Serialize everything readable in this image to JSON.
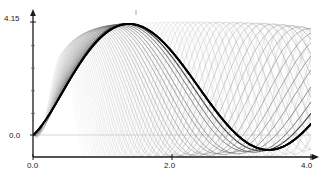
{
  "chart_data": {
    "type": "line",
    "title": "",
    "subtitle": "",
    "xlabel": "",
    "ylabel": "",
    "xlim": [
      0.0,
      4.0
    ],
    "ylim": [
      -0.62,
      4.15
    ],
    "grid": false,
    "legend": null,
    "legend_position": "none",
    "x_ticks": [
      0.0,
      2.0,
      4.0
    ],
    "x_tick_labels": [
      "0.0",
      "2.0",
      "4.0"
    ],
    "y_ticks": [
      0.0,
      4.15
    ],
    "y_tick_labels": [
      "0.0",
      "4.15"
    ],
    "annotations": [
      "ensemble of oscillatory trajectories",
      "curves clipped at upper bound 4.15",
      "trajectories converge near x=0 and re-converge near x=3.5"
    ],
    "series_count": 46,
    "series": [
      {
        "name": "traj-01",
        "frequency": 1.52,
        "phase": -0.48,
        "amplitude": 2.38,
        "offset": 1.76,
        "gray": "#111111",
        "width": 1.7,
        "opacity": 1.0
      },
      {
        "name": "traj-02",
        "frequency": 1.58,
        "phase": -0.5,
        "amplitude": 2.4,
        "offset": 1.76,
        "gray": "#2a2a2a",
        "width": 1.2,
        "opacity": 0.9
      },
      {
        "name": "traj-03",
        "frequency": 1.64,
        "phase": -0.52,
        "amplitude": 2.42,
        "offset": 1.74,
        "gray": "#3a3a3a",
        "width": 1.0,
        "opacity": 0.85
      },
      {
        "name": "traj-04",
        "frequency": 1.71,
        "phase": -0.55,
        "amplitude": 2.4,
        "offset": 1.75,
        "gray": "#444444",
        "width": 0.9,
        "opacity": 0.8
      },
      {
        "name": "traj-05",
        "frequency": 1.79,
        "phase": -0.57,
        "amplitude": 2.44,
        "offset": 1.72,
        "gray": "#4e4e4e",
        "width": 0.8,
        "opacity": 0.78
      },
      {
        "name": "traj-06",
        "frequency": 1.86,
        "phase": -0.59,
        "amplitude": 2.41,
        "offset": 1.74,
        "gray": "#555555",
        "width": 0.8,
        "opacity": 0.75
      },
      {
        "name": "traj-07",
        "frequency": 1.94,
        "phase": -0.61,
        "amplitude": 2.45,
        "offset": 1.71,
        "gray": "#5c5c5c",
        "width": 0.8,
        "opacity": 0.72
      },
      {
        "name": "traj-08",
        "frequency": 2.02,
        "phase": -0.63,
        "amplitude": 2.43,
        "offset": 1.73,
        "gray": "#626262",
        "width": 0.75,
        "opacity": 0.7
      },
      {
        "name": "traj-09",
        "frequency": 2.11,
        "phase": -0.65,
        "amplitude": 2.46,
        "offset": 1.7,
        "gray": "#686868",
        "width": 0.75,
        "opacity": 0.68
      },
      {
        "name": "traj-10",
        "frequency": 2.2,
        "phase": -0.67,
        "amplitude": 2.44,
        "offset": 1.72,
        "gray": "#6e6e6e",
        "width": 0.7,
        "opacity": 0.66
      },
      {
        "name": "traj-11",
        "frequency": 2.29,
        "phase": -0.69,
        "amplitude": 2.47,
        "offset": 1.69,
        "gray": "#737373",
        "width": 0.7,
        "opacity": 0.64
      },
      {
        "name": "traj-12",
        "frequency": 2.38,
        "phase": -0.71,
        "amplitude": 2.45,
        "offset": 1.71,
        "gray": "#787878",
        "width": 0.7,
        "opacity": 0.62
      },
      {
        "name": "traj-13",
        "frequency": 2.48,
        "phase": -0.73,
        "amplitude": 2.48,
        "offset": 1.68,
        "gray": "#7d7d7d",
        "width": 0.7,
        "opacity": 0.6
      },
      {
        "name": "traj-14",
        "frequency": 2.58,
        "phase": -0.75,
        "amplitude": 2.46,
        "offset": 1.7,
        "gray": "#818181",
        "width": 0.65,
        "opacity": 0.6
      },
      {
        "name": "traj-15",
        "frequency": 2.68,
        "phase": -0.77,
        "amplitude": 2.49,
        "offset": 1.67,
        "gray": "#858585",
        "width": 0.65,
        "opacity": 0.58
      },
      {
        "name": "traj-16",
        "frequency": 2.79,
        "phase": -0.79,
        "amplitude": 2.47,
        "offset": 1.69,
        "gray": "#898989",
        "width": 0.65,
        "opacity": 0.57
      },
      {
        "name": "traj-17",
        "frequency": 2.9,
        "phase": -0.81,
        "amplitude": 2.5,
        "offset": 1.66,
        "gray": "#8d8d8d",
        "width": 0.65,
        "opacity": 0.56
      },
      {
        "name": "traj-18",
        "frequency": 3.01,
        "phase": -0.83,
        "amplitude": 2.48,
        "offset": 1.68,
        "gray": "#909090",
        "width": 0.6,
        "opacity": 0.55
      },
      {
        "name": "traj-19",
        "frequency": 3.13,
        "phase": -0.85,
        "amplitude": 2.51,
        "offset": 1.65,
        "gray": "#939393",
        "width": 0.6,
        "opacity": 0.54
      },
      {
        "name": "traj-20",
        "frequency": 3.25,
        "phase": -0.87,
        "amplitude": 2.49,
        "offset": 1.67,
        "gray": "#969696",
        "width": 0.6,
        "opacity": 0.53
      },
      {
        "name": "traj-21",
        "frequency": 3.37,
        "phase": -0.89,
        "amplitude": 2.52,
        "offset": 1.64,
        "gray": "#999999",
        "width": 0.6,
        "opacity": 0.52
      },
      {
        "name": "traj-22",
        "frequency": 3.5,
        "phase": -0.91,
        "amplitude": 2.5,
        "offset": 1.66,
        "gray": "#9c9c9c",
        "width": 0.6,
        "opacity": 0.51
      },
      {
        "name": "traj-23",
        "frequency": 3.63,
        "phase": -0.93,
        "amplitude": 2.53,
        "offset": 1.63,
        "gray": "#9f9f9f",
        "width": 0.55,
        "opacity": 0.5
      },
      {
        "name": "traj-24",
        "frequency": 3.76,
        "phase": -0.95,
        "amplitude": 2.51,
        "offset": 1.65,
        "gray": "#a2a2a2",
        "width": 0.55,
        "opacity": 0.5
      },
      {
        "name": "traj-25",
        "frequency": 3.9,
        "phase": -0.97,
        "amplitude": 2.54,
        "offset": 1.62,
        "gray": "#a5a5a5",
        "width": 0.55,
        "opacity": 0.49
      },
      {
        "name": "traj-26",
        "frequency": 4.04,
        "phase": -0.99,
        "amplitude": 2.52,
        "offset": 1.64,
        "gray": "#a8a8a8",
        "width": 0.55,
        "opacity": 0.48
      },
      {
        "name": "traj-27",
        "frequency": 4.19,
        "phase": -1.01,
        "amplitude": 2.55,
        "offset": 1.61,
        "gray": "#ababab",
        "width": 0.55,
        "opacity": 0.47
      },
      {
        "name": "traj-28",
        "frequency": 4.34,
        "phase": -1.03,
        "amplitude": 2.53,
        "offset": 1.63,
        "gray": "#aeaeae",
        "width": 0.5,
        "opacity": 0.46
      },
      {
        "name": "traj-29",
        "frequency": 4.49,
        "phase": -1.05,
        "amplitude": 2.56,
        "offset": 1.6,
        "gray": "#b1b1b1",
        "width": 0.5,
        "opacity": 0.46
      },
      {
        "name": "traj-30",
        "frequency": 4.65,
        "phase": -1.07,
        "amplitude": 2.54,
        "offset": 1.62,
        "gray": "#b4b4b4",
        "width": 0.5,
        "opacity": 0.45
      },
      {
        "name": "traj-31",
        "frequency": 4.81,
        "phase": -1.09,
        "amplitude": 2.57,
        "offset": 1.59,
        "gray": "#b7b7b7",
        "width": 0.5,
        "opacity": 0.44
      },
      {
        "name": "traj-32",
        "frequency": 4.98,
        "phase": -1.11,
        "amplitude": 2.55,
        "offset": 1.61,
        "gray": "#bababa",
        "width": 0.5,
        "opacity": 0.44
      },
      {
        "name": "traj-33",
        "frequency": 5.15,
        "phase": -1.13,
        "amplitude": 2.58,
        "offset": 1.58,
        "gray": "#bdbdbd",
        "width": 0.5,
        "opacity": 0.43
      },
      {
        "name": "traj-34",
        "frequency": 5.33,
        "phase": -1.15,
        "amplitude": 2.56,
        "offset": 1.6,
        "gray": "#c0c0c0",
        "width": 0.5,
        "opacity": 0.42
      },
      {
        "name": "traj-35",
        "frequency": 5.51,
        "phase": -1.17,
        "amplitude": 2.59,
        "offset": 1.57,
        "gray": "#c3c3c3",
        "width": 0.5,
        "opacity": 0.42
      },
      {
        "name": "traj-36",
        "frequency": 5.7,
        "phase": -1.19,
        "amplitude": 2.57,
        "offset": 1.59,
        "gray": "#c6c6c6",
        "width": 0.45,
        "opacity": 0.41
      },
      {
        "name": "traj-37",
        "frequency": 5.89,
        "phase": -1.21,
        "amplitude": 2.6,
        "offset": 1.56,
        "gray": "#c9c9c9",
        "width": 0.45,
        "opacity": 0.4
      },
      {
        "name": "traj-38",
        "frequency": 6.09,
        "phase": -1.23,
        "amplitude": 2.58,
        "offset": 1.58,
        "gray": "#cccccc",
        "width": 0.45,
        "opacity": 0.4
      },
      {
        "name": "traj-39",
        "frequency": 6.29,
        "phase": -1.25,
        "amplitude": 2.61,
        "offset": 1.55,
        "gray": "#cfcfcf",
        "width": 0.45,
        "opacity": 0.39
      },
      {
        "name": "traj-40",
        "frequency": 6.5,
        "phase": -1.27,
        "amplitude": 2.59,
        "offset": 1.57,
        "gray": "#d2d2d2",
        "width": 0.45,
        "opacity": 0.38
      },
      {
        "name": "traj-41",
        "frequency": 6.72,
        "phase": -1.29,
        "amplitude": 2.62,
        "offset": 1.54,
        "gray": "#d4d4d4",
        "width": 0.45,
        "opacity": 0.38
      },
      {
        "name": "traj-42",
        "frequency": 6.94,
        "phase": -1.31,
        "amplitude": 2.6,
        "offset": 1.56,
        "gray": "#d7d7d7",
        "width": 0.45,
        "opacity": 0.37
      },
      {
        "name": "traj-43",
        "frequency": 7.17,
        "phase": -1.33,
        "amplitude": 2.63,
        "offset": 1.53,
        "gray": "#d9d9d9",
        "width": 0.4,
        "opacity": 0.36
      },
      {
        "name": "traj-44",
        "frequency": 7.4,
        "phase": -1.35,
        "amplitude": 2.61,
        "offset": 1.55,
        "gray": "#dbdbdb",
        "width": 0.4,
        "opacity": 0.36
      },
      {
        "name": "traj-45",
        "frequency": 7.64,
        "phase": -1.37,
        "amplitude": 2.64,
        "offset": 1.52,
        "gray": "#dddddd",
        "width": 0.4,
        "opacity": 0.35
      },
      {
        "name": "traj-46",
        "frequency": 7.89,
        "phase": -1.39,
        "amplitude": 2.62,
        "offset": 1.54,
        "gray": "#dfdfdf",
        "width": 0.4,
        "opacity": 0.34
      }
    ],
    "highlighted_series": [
      {
        "name": "bold-left",
        "frequency": 1.52,
        "phase": -0.48,
        "amplitude": 2.38,
        "offset": 1.76,
        "gray": "#000000",
        "width": 1.9,
        "opacity": 1.0
      },
      {
        "name": "bold-right",
        "frequency": 1.52,
        "phase": -0.48,
        "amplitude": 2.38,
        "offset": 1.76,
        "gray": "#000000",
        "width": 1.9,
        "opacity": 1.0
      }
    ],
    "zero_line": {
      "value": 0.0,
      "color": "#bbbbbb"
    },
    "clip_top": 4.15
  },
  "axis": {
    "y_top_label": "4.15",
    "y_zero_label": "0.0",
    "x_start_label": "0.0",
    "x_mid_label": "2.0",
    "x_end_label": "4.0",
    "axis_color": "#1a1a1a"
  }
}
